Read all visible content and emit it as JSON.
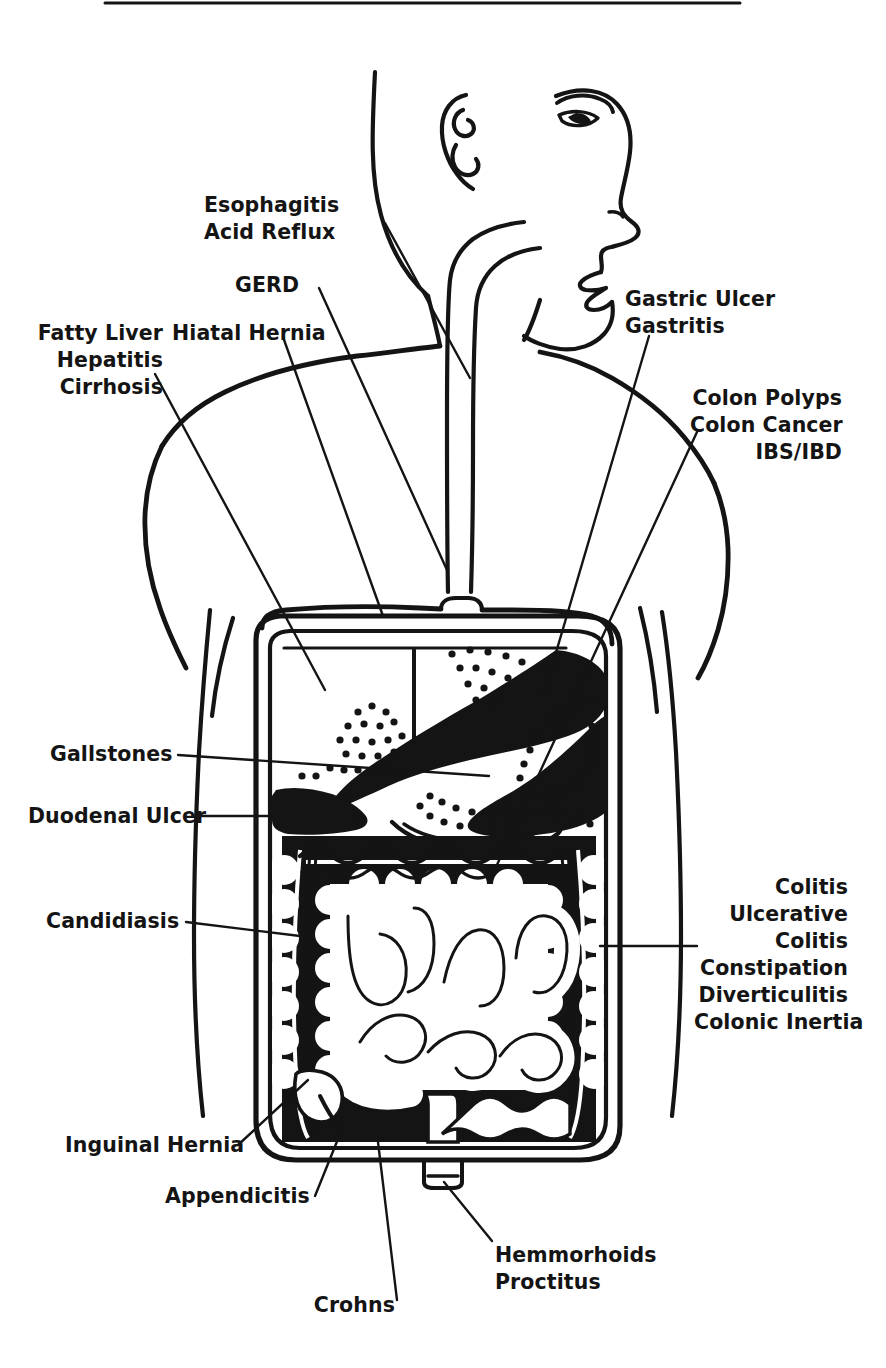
{
  "figure": {
    "top_rule": {
      "x1": 105,
      "x2": 740,
      "y": 3
    },
    "ink_color": "#141414",
    "paper_color": "#ffffff"
  },
  "labels": [
    {
      "id": "esophagitis-acid-reflux",
      "lines": [
        "Esophagitis",
        "Acid Reflux"
      ],
      "align": "left",
      "x": 204,
      "y": 192,
      "leader": {
        "x1": 385,
        "y1": 223,
        "x2": 470,
        "y2": 378
      }
    },
    {
      "id": "gerd",
      "lines": [
        "GERD"
      ],
      "align": "left",
      "x": 235,
      "y": 272,
      "leader": {
        "x1": 319,
        "y1": 288,
        "x2": 447,
        "y2": 570
      }
    },
    {
      "id": "fatty-liver-hepatitis-cirrhosis",
      "lines": [
        "Fatty Liver",
        "Hepatitis",
        "Cirrhosis"
      ],
      "align": "right",
      "x": 43,
      "y": 320,
      "width": 120,
      "leader": {
        "x1": 155,
        "y1": 374,
        "x2": 325,
        "y2": 690
      }
    },
    {
      "id": "hiatal-hernia",
      "lines": [
        "Hiatal Hernia"
      ],
      "align": "left",
      "x": 172,
      "y": 320,
      "leader": {
        "x1": 283,
        "y1": 337,
        "x2": 383,
        "y2": 616
      }
    },
    {
      "id": "gastric-ulcer-gastritis",
      "lines": [
        "Gastric Ulcer",
        "Gastritis"
      ],
      "align": "left",
      "x": 625,
      "y": 286,
      "leader": {
        "x1": 649,
        "y1": 336,
        "x2": 545,
        "y2": 690
      }
    },
    {
      "id": "colon-polyps-colon-cancer-ibs-ibd",
      "lines": [
        "Colon Polyps",
        "Colon Cancer",
        "IBS/IBD"
      ],
      "align": "right",
      "x": 700,
      "y": 385,
      "width": 140,
      "leader": {
        "x1": 697,
        "y1": 432,
        "x2": 490,
        "y2": 880
      }
    },
    {
      "id": "gallstones",
      "lines": [
        "Gallstones"
      ],
      "align": "right",
      "x": 60,
      "y": 741,
      "width": 110,
      "leader": {
        "x1": 178,
        "y1": 755,
        "x2": 489,
        "y2": 776
      }
    },
    {
      "id": "duodenal-ulcer",
      "lines": [
        "Duodenal Ulcer"
      ],
      "align": "right",
      "x": 38,
      "y": 803,
      "width": 155,
      "leader": {
        "x1": 200,
        "y1": 816,
        "x2": 352,
        "y2": 816
      }
    },
    {
      "id": "candidiasis",
      "lines": [
        "Candidiasis"
      ],
      "align": "right",
      "x": 56,
      "y": 908,
      "width": 120,
      "leader": {
        "x1": 186,
        "y1": 922,
        "x2": 300,
        "y2": 936
      }
    },
    {
      "id": "colitis-group",
      "lines": [
        "Colitis",
        "Ulcerative",
        "Colitis",
        "Constipation",
        "Diverticulitis",
        "Colonic Inertia"
      ],
      "align": "right",
      "x": 700,
      "y": 874,
      "width": 148,
      "leader": {
        "x1": 697,
        "y1": 946,
        "x2": 600,
        "y2": 946
      }
    },
    {
      "id": "inguinal-hernia",
      "lines": [
        "Inguinal Hernia"
      ],
      "align": "right",
      "x": 75,
      "y": 1132,
      "width": 155,
      "leader": {
        "x1": 238,
        "y1": 1145,
        "x2": 308,
        "y2": 1080
      }
    },
    {
      "id": "appendicitis",
      "lines": [
        "Appendicitis"
      ],
      "align": "right",
      "x": 175,
      "y": 1183,
      "width": 130,
      "leader": {
        "x1": 315,
        "y1": 1196,
        "x2": 340,
        "y2": 1134
      }
    },
    {
      "id": "crohns",
      "lines": [
        "Crohns"
      ],
      "align": "right",
      "x": 315,
      "y": 1306,
      "width": 90,
      "leader": {
        "x1": 397,
        "y1": 1300,
        "x2": 378,
        "y2": 1142
      }
    },
    {
      "id": "hemmorhoids-proctitus",
      "lines": [
        "Hemmorhoids",
        "Proctitus"
      ],
      "align": "left",
      "x": 495,
      "y": 1242,
      "leader": {
        "x1": 492,
        "y1": 1241,
        "x2": 444,
        "y2": 1182
      }
    }
  ],
  "anatomy": {
    "parts": [
      "head-profile",
      "ear",
      "eye",
      "nose",
      "lips",
      "chin",
      "neck",
      "shoulders",
      "left-arm",
      "right-arm",
      "torso",
      "esophagus",
      "diaphragm",
      "abdominal-cavity",
      "liver",
      "gallbladder",
      "stomach",
      "pancreas",
      "duodenum",
      "small-intestine",
      "colon",
      "cecum",
      "appendix",
      "rectum"
    ]
  }
}
